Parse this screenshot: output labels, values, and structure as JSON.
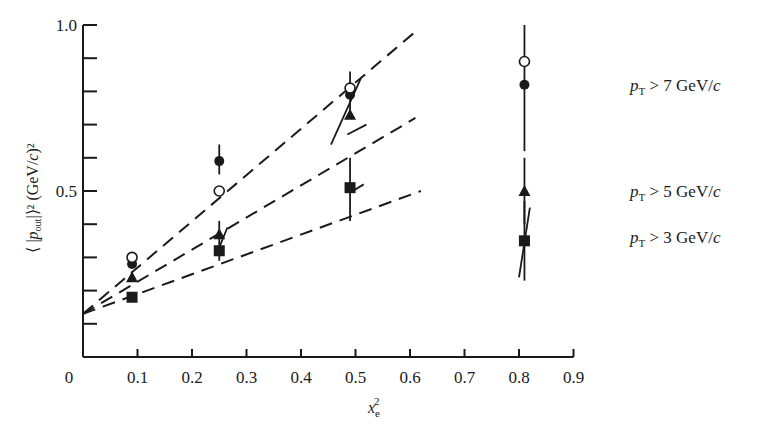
{
  "chart_data": {
    "type": "scatter",
    "title": "",
    "xlabel": "x_e^2",
    "xlabel_main": "x",
    "xlabel_sub": "e",
    "xlabel_sup": "2",
    "ylabel": "⟨ |p_out| ⟩² (GeV/c)²",
    "xlim": [
      0,
      0.9
    ],
    "ylim": [
      0,
      1.0
    ],
    "x_ticks": [
      0,
      0.1,
      0.2,
      0.3,
      0.4,
      0.5,
      0.6,
      0.7,
      0.8,
      0.9
    ],
    "x_tick_labels": [
      "0",
      "0.1",
      "0.2",
      "0.3",
      "0.4",
      "0.5",
      "0.6",
      "0.7",
      "0.8",
      "0.9"
    ],
    "y_ticks": [
      0.1,
      0.2,
      0.3,
      0.4,
      0.5,
      0.6,
      0.7,
      0.8,
      0.9,
      1.0
    ],
    "y_tick_labels": {
      "0.5": "0.5",
      "1.0": "1.0"
    },
    "grid": false,
    "legend_position": "right, inline labels",
    "series": [
      {
        "name": "p_T > 7 GeV/c",
        "label_main": "p",
        "label_sub": "T",
        "label_rest": " > 7 GeV/c",
        "marker": "filled-circle",
        "x": [
          0.09,
          0.25,
          0.49,
          0.81
        ],
        "y": [
          0.28,
          0.59,
          0.79,
          0.82
        ],
        "fit_line": {
          "x0": 0.0,
          "y0": 0.13,
          "x1": 0.61,
          "y1": 0.98
        }
      },
      {
        "name": "open circles (p_T > 7 GeV/c, alternate)",
        "marker": "open-circle",
        "x": [
          0.09,
          0.25,
          0.49,
          0.81
        ],
        "y": [
          0.3,
          0.5,
          0.81,
          0.89
        ]
      },
      {
        "name": "p_T > 5 GeV/c",
        "label_main": "p",
        "label_sub": "T",
        "label_rest": " > 5 GeV/c",
        "marker": "filled-triangle",
        "x": [
          0.09,
          0.25,
          0.49,
          0.81
        ],
        "y": [
          0.24,
          0.37,
          0.73,
          0.5
        ],
        "fit_line": {
          "x0": 0.0,
          "y0": 0.13,
          "x1": 0.61,
          "y1": 0.72
        }
      },
      {
        "name": "p_T > 3 GeV/c",
        "label_main": "p",
        "label_sub": "T",
        "label_rest": " > 3 GeV/c",
        "marker": "filled-square",
        "x": [
          0.09,
          0.25,
          0.49,
          0.81
        ],
        "y": [
          0.18,
          0.32,
          0.51,
          0.35
        ],
        "fit_line": {
          "x0": 0.0,
          "y0": 0.13,
          "x1": 0.62,
          "y1": 0.5
        }
      }
    ],
    "error_bars": [
      {
        "x": 0.25,
        "y_low": 0.55,
        "y_high": 0.64
      },
      {
        "x": 0.25,
        "y_low": 0.29,
        "y_high": 0.41
      },
      {
        "x": 0.49,
        "y_low": 0.72,
        "y_high": 0.86
      },
      {
        "x": 0.49,
        "y_low": 0.41,
        "y_high": 0.6
      },
      {
        "x": 0.81,
        "y_low": 0.62,
        "y_high": 1.0
      },
      {
        "x": 0.81,
        "y_low": 0.4,
        "y_high": 0.6
      },
      {
        "x": 0.81,
        "y_low": 0.23,
        "y_high": 0.47
      }
    ],
    "slope_segments": [
      {
        "x0": 0.245,
        "y0": 0.31,
        "x1": 0.265,
        "y1": 0.39
      },
      {
        "x0": 0.455,
        "y0": 0.64,
        "x1": 0.51,
        "y1": 0.84
      },
      {
        "x0": 0.485,
        "y0": 0.67,
        "x1": 0.52,
        "y1": 0.7
      },
      {
        "x0": 0.495,
        "y0": 0.5,
        "x1": 0.515,
        "y1": 0.52
      },
      {
        "x0": 0.8,
        "y0": 0.24,
        "x1": 0.82,
        "y1": 0.45
      }
    ],
    "legend": [
      {
        "text_main": "p",
        "text_sub": "T",
        "text_rest": " > 7 GeV/c",
        "y": 0.82
      },
      {
        "text_main": "p",
        "text_sub": "T",
        "text_rest": " > 5 GeV/c",
        "y": 0.5
      },
      {
        "text_main": "p",
        "text_sub": "T",
        "text_rest": " > 3 GeV/c",
        "y": 0.36
      }
    ]
  },
  "colors": {
    "ink": "#1a1a1a",
    "background": "#ffffff"
  }
}
